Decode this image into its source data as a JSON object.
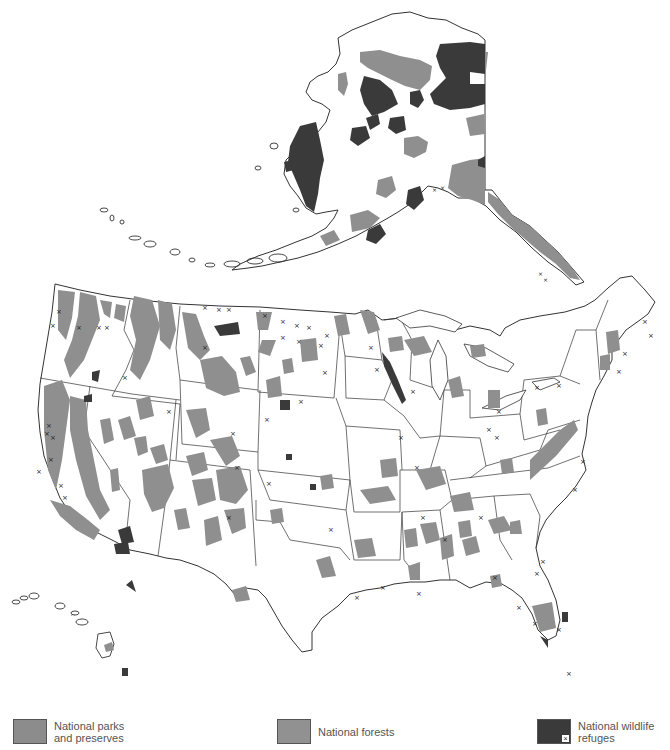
{
  "map": {
    "title": "Federal lands of the United States",
    "regions": [
      "Alaska",
      "Contiguous United States",
      "Hawaii"
    ],
    "colors": {
      "background": "#ffffff",
      "land": "#ffffff",
      "outline": "#333333",
      "national_parks": "#8c8c8c",
      "national_forests": "#8f8f8f",
      "wildlife_refuges": "#3a3a3a",
      "refuge_marker": "#222222"
    },
    "refuge_marker_glyph": "×"
  },
  "legend": {
    "items": [
      {
        "id": "parks",
        "label": "National parks\nand preserves",
        "color": "#8c8c8c",
        "marker": false
      },
      {
        "id": "forests",
        "label": "National forests",
        "color": "#919191",
        "marker": false
      },
      {
        "id": "refuges",
        "label": "National wildlife\nrefuges",
        "color": "#3a3a3a",
        "marker": true,
        "marker_glyph": "×"
      }
    ]
  }
}
